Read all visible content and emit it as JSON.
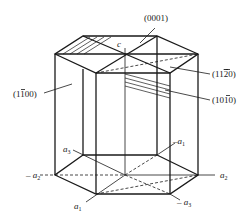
{
  "figure": {
    "type": "hexagonal crystal prism with Miller-Bravais indices",
    "colors": {
      "line": "#1a1a1a",
      "background": "#ffffff"
    }
  },
  "planes": {
    "basal": "(0001)",
    "prism_a": "(11̅2̅0)",
    "prism_b": "(101̅0)",
    "prism_c": "(11̅ 00)"
  },
  "plane_labels": [
    {
      "text_main": "(0001)"
    },
    {
      "text_pre": "(11",
      "bar": "2",
      "text_post": "0)"
    },
    {
      "text_pre": "(10",
      "bar": "1",
      "text_post": "0)"
    },
    {
      "text_pre": "(1",
      "bar": "1",
      "text_post": "00)"
    }
  ],
  "axes": {
    "c": "c",
    "a1": {
      "base": "a",
      "sub": "1"
    },
    "neg_a1": {
      "base": "–a",
      "sub": "1"
    },
    "a2": {
      "base": "a",
      "sub": "2"
    },
    "neg_a2": {
      "base": "– a",
      "sub": "2"
    },
    "a3": {
      "base": "a",
      "sub": "3"
    },
    "neg_a3": {
      "base": "– a",
      "sub": "3"
    }
  }
}
